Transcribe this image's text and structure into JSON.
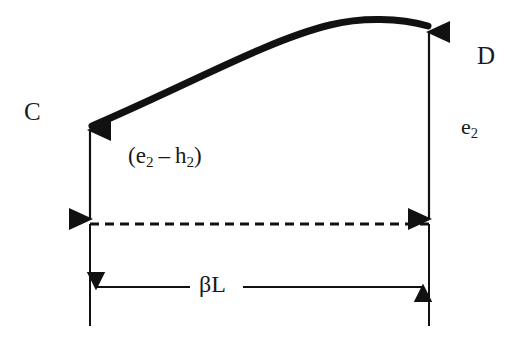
{
  "figure": {
    "background_color": "#ffffff",
    "line_color": "#111111",
    "width": 524,
    "height": 339
  },
  "labels": {
    "node_left": "C",
    "node_right": "D",
    "vertical_right": {
      "base": "e",
      "sub": "2"
    },
    "vertical_left_expression": {
      "open": "(",
      "term1_base": "e",
      "term1_sub": "2",
      "operator": "–",
      "term2_base": "h",
      "term2_sub": "2",
      "close": ")"
    },
    "horizontal_dimension": "βL"
  },
  "geometry": {
    "curve": {
      "name": "deflection-curve",
      "start": [
        90,
        127
      ],
      "control1": [
        210,
        72
      ],
      "control2": [
        300,
        22
      ],
      "peak": [
        378,
        19
      ],
      "end": [
        429,
        27
      ],
      "stroke_width": 7
    },
    "arrow_left_vertical": {
      "name": "height-arrow-left",
      "x": 90,
      "top_y": 125,
      "bottom_y": 223,
      "double_headed": true
    },
    "arrow_right_vertical": {
      "name": "height-arrow-right",
      "x": 429,
      "top_y": 26,
      "bottom_y": 223,
      "double_headed": true
    },
    "dashed_reference_line": {
      "name": "datum-line",
      "y": 224,
      "x_start": 90,
      "x_end": 429,
      "dash": "9 6"
    },
    "extension_line_left": {
      "name": "extension-line-left",
      "x": 90,
      "y_start": 224,
      "y_end": 326
    },
    "extension_line_right": {
      "name": "extension-line-right",
      "x": 429,
      "y_start": 224,
      "y_end": 326
    },
    "dimension_line": {
      "name": "span-dimension-line",
      "y": 287,
      "left_segment": [
        90,
        190
      ],
      "right_segment": [
        243,
        429
      ],
      "double_headed": true
    }
  }
}
